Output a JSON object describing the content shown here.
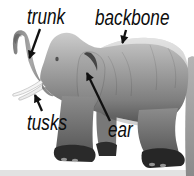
{
  "figure": {
    "type": "labeled-diagram",
    "background_color": "#ffffff",
    "labels": [
      {
        "id": "trunk",
        "text": "trunk"
      },
      {
        "id": "backbone",
        "text": "backbone"
      },
      {
        "id": "tusks",
        "text": "tusks"
      },
      {
        "id": "ear",
        "text": "ear"
      }
    ],
    "label_style": {
      "color": "#0d0d0d",
      "italic": true
    },
    "arrow_color": "#111111",
    "image": {
      "name": "elephant-photo",
      "palette": {
        "body_light": "#cccccc",
        "body_mid": "#909090",
        "body_dark": "#565656",
        "legs": "#707070",
        "feet": "#262626",
        "tusk": "#f4f4f4",
        "ground": "#e0e0e0"
      }
    }
  }
}
